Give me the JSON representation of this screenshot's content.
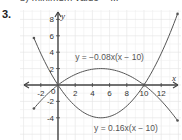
{
  "header": {
    "cut_line": "b) minimum value = ...",
    "question_number": "3."
  },
  "chart_data": {
    "type": "line",
    "title": "",
    "xlabel": "x",
    "ylabel": "y",
    "xlim": [
      -4.5,
      14
    ],
    "ylim": [
      -6.5,
      9.5
    ],
    "grid": true,
    "x_ticks": [
      -2,
      0,
      2,
      4,
      6,
      8,
      10,
      12
    ],
    "x_tick_labels": [
      "-2",
      "0",
      "2",
      "4",
      "6",
      "8",
      "10",
      "12"
    ],
    "y_ticks": [
      -4,
      -2,
      2,
      4,
      6,
      8
    ],
    "y_tick_labels": [
      "-4",
      "-2",
      "2",
      "4",
      "6",
      "8"
    ],
    "series": [
      {
        "name": "y = −0.08x(x − 10)",
        "a": -0.08,
        "roots": [
          0,
          10
        ],
        "vertex": [
          5,
          2
        ],
        "x_range": [
          -2.8,
          13.9
        ],
        "label_pos": [
          2.0,
          3.0
        ]
      },
      {
        "name": "y = 0.16x(x − 10)",
        "a": 0.16,
        "roots": [
          0,
          10
        ],
        "vertex": [
          5,
          -4
        ],
        "x_range": [
          -2.8,
          13.9
        ],
        "label_pos": [
          4.2,
          -5.6
        ]
      }
    ]
  }
}
